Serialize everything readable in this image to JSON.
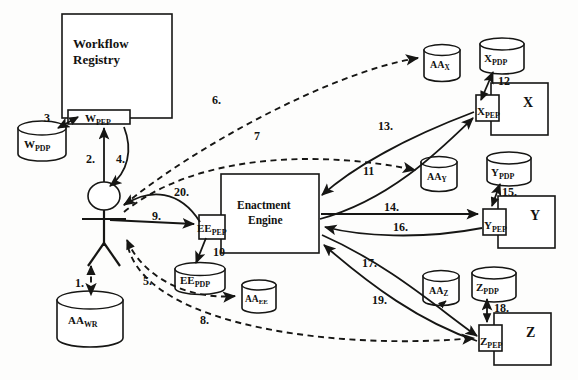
{
  "diagram": {
    "type": "architecture-flow-diagram",
    "background_color": "#fdfdfc",
    "line_color": "#161614"
  },
  "nodes": {
    "workflow_registry": {
      "label_line1": "Workflow",
      "label_line2": "Registry",
      "shape": "rectangle"
    },
    "w_pep": {
      "base": "W",
      "sub": "PEP",
      "shape": "rectangle"
    },
    "w_pdp": {
      "base": "W",
      "sub": "PDP",
      "shape": "cylinder"
    },
    "actor": {
      "name": "user-actor",
      "shape": "stick-figure"
    },
    "aa_wr": {
      "base": "AA",
      "sub": "WR",
      "shape": "cylinder"
    },
    "enactment_engine": {
      "label_line1": "Enactment",
      "label_line2": "Engine",
      "shape": "rectangle"
    },
    "ee_pep": {
      "base": "EE",
      "sub": "PEP",
      "shape": "rectangle"
    },
    "ee_pdp": {
      "base": "EE",
      "sub": "PDP",
      "shape": "cylinder"
    },
    "aa_ee": {
      "base": "AA",
      "sub": "EE",
      "shape": "cylinder"
    },
    "aa_x": {
      "base": "AA",
      "sub": "X",
      "shape": "cylinder"
    },
    "x_pdp": {
      "base": "X",
      "sub": "PDP",
      "shape": "cylinder"
    },
    "x_pep": {
      "base": "X",
      "sub": "PEP",
      "shape": "rectangle"
    },
    "service_x": {
      "label": "X",
      "shape": "rectangle"
    },
    "aa_y": {
      "base": "AA",
      "sub": "Y",
      "shape": "cylinder"
    },
    "y_pdp": {
      "base": "Y",
      "sub": "PDP",
      "shape": "cylinder"
    },
    "y_pep": {
      "base": "Y",
      "sub": "PEP",
      "shape": "rectangle"
    },
    "service_y": {
      "label": "Y",
      "shape": "rectangle"
    },
    "aa_z": {
      "base": "AA",
      "sub": "Z",
      "shape": "cylinder"
    },
    "z_pdp": {
      "base": "Z",
      "sub": "PDP",
      "shape": "cylinder"
    },
    "z_pep": {
      "base": "Z",
      "sub": "PEP",
      "shape": "rectangle"
    },
    "service_z": {
      "label": "Z",
      "shape": "rectangle"
    }
  },
  "step_labels": {
    "s1": "1.",
    "s2": "2.",
    "s3": "3",
    "s4": "4.",
    "s5": "5.",
    "s6": "6.",
    "s7": "7",
    "s8": "8.",
    "s9": "9.",
    "s10": "10",
    "s11": "11",
    "s12": "12",
    "s13": "13.",
    "s14": "14.",
    "s15": "15.",
    "s16": "16.",
    "s17": "17.",
    "s18": "18.",
    "s19": "19.",
    "s20": "20."
  },
  "edges": [
    {
      "id": "e1",
      "label": "1.",
      "from": "actor",
      "to": "aa_wr",
      "style": "dashed"
    },
    {
      "id": "e2",
      "label": "2.",
      "from": "actor",
      "to": "w_pep",
      "style": "solid"
    },
    {
      "id": "e3",
      "label": "3",
      "from": "w_pep",
      "to": "w_pdp",
      "style": "solid"
    },
    {
      "id": "e4",
      "label": "4.",
      "from": "w_pep",
      "to": "actor",
      "style": "solid"
    },
    {
      "id": "e5",
      "label": "5.",
      "from": "actor",
      "to": "aa_ee",
      "style": "dashed"
    },
    {
      "id": "e6",
      "label": "6.",
      "from": "actor",
      "to": "aa_x",
      "style": "dashed"
    },
    {
      "id": "e7",
      "label": "7",
      "from": "actor",
      "to": "aa_y",
      "style": "dashed"
    },
    {
      "id": "e8",
      "label": "8.",
      "from": "actor",
      "to": "z_pep",
      "style": "dashed"
    },
    {
      "id": "e9",
      "label": "9.",
      "from": "actor",
      "to": "ee_pep",
      "style": "solid"
    },
    {
      "id": "e10",
      "label": "10",
      "from": "ee_pep",
      "to": "ee_pdp",
      "style": "solid"
    },
    {
      "id": "e11",
      "label": "11",
      "from": "x_pep",
      "to": "enactment_engine",
      "style": "solid"
    },
    {
      "id": "e12",
      "label": "12",
      "from": "x_pep",
      "to": "x_pdp",
      "style": "solid"
    },
    {
      "id": "e13",
      "label": "13.",
      "from": "enactment_engine",
      "to": "x_pep",
      "style": "solid"
    },
    {
      "id": "e14",
      "label": "14.",
      "from": "enactment_engine",
      "to": "y_pep",
      "style": "solid"
    },
    {
      "id": "e15",
      "label": "15.",
      "from": "y_pep",
      "to": "y_pdp",
      "style": "solid"
    },
    {
      "id": "e16",
      "label": "16.",
      "from": "y_pep",
      "to": "enactment_engine",
      "style": "solid"
    },
    {
      "id": "e17",
      "label": "17.",
      "from": "enactment_engine",
      "to": "z_pep",
      "style": "solid"
    },
    {
      "id": "e18",
      "label": "18.",
      "from": "z_pep",
      "to": "z_pdp",
      "style": "solid"
    },
    {
      "id": "e19",
      "label": "19.",
      "from": "z_pep",
      "to": "enactment_engine",
      "style": "solid"
    },
    {
      "id": "e20",
      "label": "20.",
      "from": "ee_pep",
      "to": "actor",
      "style": "solid"
    }
  ]
}
